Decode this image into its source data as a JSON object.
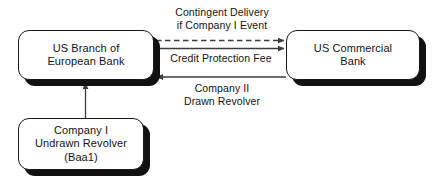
{
  "diagram": {
    "background_color": "#ffffff",
    "line_color": "#3d3d3d",
    "text_color": "#141414",
    "shadow_color": "#111111",
    "nodes": [
      {
        "id": "us-branch-european-bank",
        "label": "US Branch of\nEuropean Bank",
        "x": 18,
        "y": 30,
        "width": 136,
        "height": 50
      },
      {
        "id": "us-commercial-bank",
        "label": "US Commercial\nBank",
        "x": 286,
        "y": 30,
        "width": 134,
        "height": 50
      },
      {
        "id": "company-i-undrawn-revolver",
        "label": "Company I\nUndrawn Revolver\n(Baa1)",
        "x": 18,
        "y": 118,
        "width": 126,
        "height": 52
      }
    ],
    "edges": [
      {
        "id": "contingent-delivery",
        "label": "Contingent Delivery\nif Company I Event",
        "style": "dashed",
        "direction": "right",
        "from": "us-branch-european-bank",
        "to": "us-commercial-bank",
        "label_x": 172,
        "label_y": 6
      },
      {
        "id": "credit-protection-fee",
        "label": "Credit Protection Fee",
        "style": "solid",
        "direction": "right",
        "from": "us-branch-european-bank",
        "to": "us-commercial-bank",
        "label_x": 161,
        "label_y": 51
      },
      {
        "id": "company-ii-drawn-revolver",
        "label": "Company II\nDrawn Revolver",
        "style": "solid",
        "direction": "left",
        "from": "us-commercial-bank",
        "to": "us-branch-european-bank",
        "label_x": 172,
        "label_y": 82
      },
      {
        "id": "company-i-to-branch",
        "label": "",
        "style": "solid",
        "direction": "up",
        "from": "company-i-undrawn-revolver",
        "to": "us-branch-european-bank"
      }
    ]
  }
}
